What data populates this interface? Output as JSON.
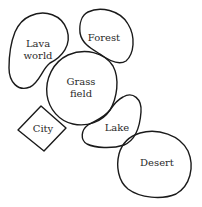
{
  "diagram": {
    "title": "",
    "stroke_color": "#1a1a1a",
    "text_color": "#2a2a2a",
    "regions": [
      {
        "id": "lava-world",
        "label_line1": "Lava",
        "label_line2": "world",
        "shape": "blob"
      },
      {
        "id": "forest",
        "label_line1": "Forest",
        "shape": "blob"
      },
      {
        "id": "grass-field",
        "label_line1": "Grass",
        "label_line2": "field",
        "shape": "blob"
      },
      {
        "id": "city",
        "label_line1": "City",
        "shape": "diamond"
      },
      {
        "id": "lake",
        "label_line1": "Lake",
        "shape": "blob"
      },
      {
        "id": "desert",
        "label_line1": "Desert",
        "shape": "blob"
      }
    ]
  }
}
